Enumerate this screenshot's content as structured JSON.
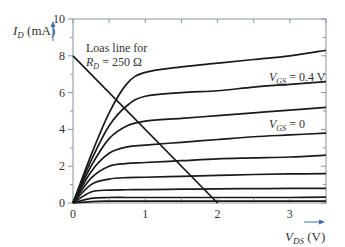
{
  "chart_data": {
    "type": "line",
    "title": "",
    "xlabel": "V_DS (V)",
    "ylabel": "I_D (mA)",
    "xlim": [
      0,
      3.5
    ],
    "ylim": [
      0,
      10
    ],
    "xticks": [
      0,
      1,
      2,
      3
    ],
    "yticks": [
      0,
      2,
      4,
      6,
      8,
      10
    ],
    "grid": false,
    "x": [
      0,
      0.25,
      0.5,
      0.75,
      1.0,
      1.5,
      2.0,
      2.5,
      3.0,
      3.5
    ],
    "series": [
      {
        "name": "curve-1",
        "values": [
          0,
          2.6,
          4.9,
          6.5,
          7.1,
          7.4,
          7.6,
          7.8,
          8.0,
          8.3
        ]
      },
      {
        "name": "curve-2 (V_GS = 0.4 V)",
        "values": [
          0,
          2.3,
          4.2,
          5.3,
          5.8,
          6.0,
          6.1,
          6.3,
          6.45,
          6.6
        ]
      },
      {
        "name": "curve-3",
        "values": [
          0,
          2.0,
          3.5,
          4.2,
          4.45,
          4.6,
          4.75,
          4.9,
          5.05,
          5.2
        ]
      },
      {
        "name": "curve-4 (V_GS = 0)",
        "values": [
          0,
          1.7,
          2.7,
          3.05,
          3.15,
          3.3,
          3.45,
          3.6,
          3.7,
          3.8
        ]
      },
      {
        "name": "curve-5",
        "values": [
          0,
          1.35,
          2.0,
          2.15,
          2.2,
          2.3,
          2.4,
          2.45,
          2.5,
          2.6
        ]
      },
      {
        "name": "curve-6",
        "values": [
          0,
          1.0,
          1.3,
          1.38,
          1.4,
          1.45,
          1.5,
          1.55,
          1.58,
          1.6
        ]
      },
      {
        "name": "curve-7",
        "values": [
          0,
          0.6,
          0.7,
          0.72,
          0.73,
          0.75,
          0.77,
          0.78,
          0.79,
          0.8
        ]
      },
      {
        "name": "curve-8",
        "values": [
          0,
          0.25,
          0.3,
          0.3,
          0.3,
          0.3,
          0.3,
          0.3,
          0.3,
          0.32
        ]
      },
      {
        "name": "curve-9",
        "values": [
          0,
          0.08,
          0.1,
          0.1,
          0.1,
          0.1,
          0.1,
          0.1,
          0.1,
          0.1
        ]
      }
    ],
    "load_line": {
      "name": "Load line for R_D = 250 Ω",
      "x": [
        0,
        2
      ],
      "y": [
        8,
        0
      ]
    },
    "annotations": [
      {
        "text": "Loas line for",
        "x": 0.15,
        "y": 7.6
      },
      {
        "text": "R_D = 250 Ω",
        "x": 0.15,
        "y": 6.9
      },
      {
        "text": "V_GS = 0.4 V",
        "x": 2.55,
        "y": 6.9
      },
      {
        "text": "V_GS = 0",
        "x": 2.7,
        "y": 4.1
      }
    ]
  },
  "labels": {
    "y_axis_main": "I",
    "y_axis_sub": "D",
    "y_axis_unit": " (mA)",
    "x_axis_main": "V",
    "x_axis_sub": "DS",
    "x_axis_unit": " (V)",
    "load_line_1": "Loas line for",
    "load_line_2_main": "R",
    "load_line_2_sub": "D",
    "load_line_2_rest": " = 250 Ω",
    "vgs04_main": "V",
    "vgs04_sub": "GS",
    "vgs04_rest": " = 0.4 V",
    "vgs0_main": "V",
    "vgs0_sub": "GS",
    "vgs0_rest": " = 0"
  },
  "colors": {
    "curve": "#1a1a1a",
    "frame": "#8a94a0",
    "arrow": "#3b6fb0",
    "text": "#333333"
  }
}
